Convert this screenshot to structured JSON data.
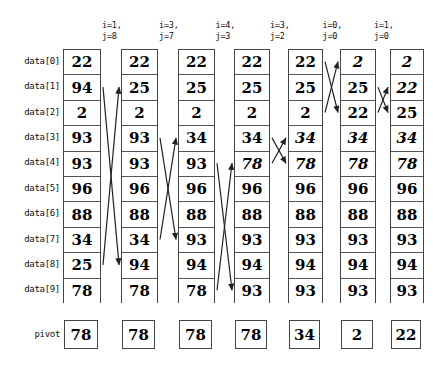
{
  "diagram": {
    "title_labels": {
      "row_label_prefix": "data",
      "pivot_label": "pivot"
    },
    "row_labels": [
      "data[0]",
      "data[1]",
      "data[2]",
      "data[3]",
      "data[4]",
      "data[5]",
      "data[6]",
      "data[7]",
      "data[8]",
      "data[9]"
    ],
    "pivot_label": "pivot",
    "headers": [
      {
        "i": "i=1,",
        "j": "j=8"
      },
      {
        "i": "i=3,",
        "j": "j=7"
      },
      {
        "i": "i=4,",
        "j": "j=3"
      },
      {
        "i": "i=3,",
        "j": "j=2"
      },
      {
        "i": "i=0,",
        "j": "j=0"
      },
      {
        "i": "i=1,",
        "j": "j=0"
      }
    ],
    "columns": [
      {
        "name": "column-1",
        "values": [
          "22",
          "94",
          "2",
          "93",
          "93",
          "96",
          "88",
          "34",
          "25",
          "78"
        ],
        "italic": [
          false,
          false,
          false,
          false,
          false,
          false,
          false,
          false,
          false,
          false
        ],
        "pivot": "78"
      },
      {
        "name": "column-2",
        "values": [
          "22",
          "25",
          "2",
          "93",
          "93",
          "96",
          "88",
          "34",
          "94",
          "78"
        ],
        "italic": [
          false,
          false,
          false,
          false,
          false,
          false,
          false,
          false,
          false,
          false
        ],
        "pivot": "78"
      },
      {
        "name": "column-3",
        "values": [
          "22",
          "25",
          "2",
          "34",
          "93",
          "96",
          "88",
          "93",
          "94",
          "78"
        ],
        "italic": [
          false,
          false,
          false,
          false,
          false,
          false,
          false,
          false,
          false,
          false
        ],
        "pivot": "78"
      },
      {
        "name": "column-4",
        "values": [
          "22",
          "25",
          "2",
          "34",
          "78",
          "96",
          "88",
          "93",
          "94",
          "93"
        ],
        "italic": [
          false,
          false,
          false,
          false,
          true,
          false,
          false,
          false,
          false,
          false
        ],
        "pivot": "78"
      },
      {
        "name": "column-5",
        "values": [
          "22",
          "25",
          "2",
          "34",
          "78",
          "96",
          "88",
          "93",
          "94",
          "93"
        ],
        "italic": [
          false,
          false,
          false,
          true,
          true,
          false,
          false,
          false,
          false,
          false
        ],
        "pivot": "34"
      },
      {
        "name": "column-6",
        "values": [
          "2",
          "25",
          "22",
          "34",
          "78",
          "96",
          "88",
          "93",
          "94",
          "93"
        ],
        "italic": [
          true,
          false,
          false,
          true,
          true,
          false,
          false,
          false,
          false,
          false
        ],
        "pivot": "2"
      },
      {
        "name": "column-7",
        "values": [
          "2",
          "22",
          "25",
          "34",
          "78",
          "96",
          "88",
          "93",
          "94",
          "93"
        ],
        "italic": [
          true,
          true,
          false,
          true,
          true,
          false,
          false,
          false,
          false,
          false
        ],
        "pivot": "22"
      }
    ],
    "swaps": [
      {
        "gap": 0,
        "from_row": 1,
        "to_row": 8
      },
      {
        "gap": 1,
        "from_row": 3,
        "to_row": 7
      },
      {
        "gap": 2,
        "from_row": 4,
        "to_row": 9
      },
      {
        "gap": 3,
        "from_row": 3,
        "to_row": 4
      },
      {
        "gap": 4,
        "from_row": 0,
        "to_row": 2
      },
      {
        "gap": 5,
        "from_row": 1,
        "to_row": 2
      }
    ],
    "colors": {
      "background": "#ffffff",
      "box_border": "#444444",
      "cell_border": "#555555",
      "text": "#000000",
      "arrow": "#222222"
    }
  }
}
